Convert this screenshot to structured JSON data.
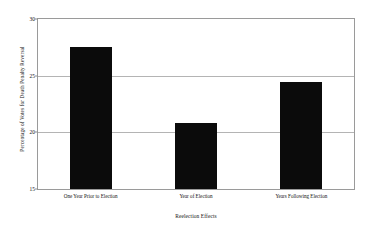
{
  "chart_data": {
    "type": "bar",
    "title": "",
    "subtitle": "",
    "xlabel": "Reelection Effects",
    "ylabel": "Percentage of Votes for Death Penalty Reversal",
    "categories": [
      "One Year Prior to Election",
      "Year of Election",
      "Years Following Election"
    ],
    "values": [
      27.5,
      20.8,
      24.4
    ],
    "series": [
      {
        "name": "Percentage of Votes for Death Penalty Reversal",
        "values": [
          27.5,
          20.8,
          24.4
        ]
      }
    ],
    "ylim": [
      15,
      30
    ],
    "yticks": [
      15,
      20,
      25,
      30
    ],
    "ytick_labels": [
      "15",
      "20",
      "25",
      "30"
    ],
    "xlim": [
      0,
      3
    ],
    "grid": true,
    "grid_axis": "y",
    "legend": false,
    "legend_position": "none",
    "bar_color": "#0b0b0b",
    "grid_color": "#b4b4b4",
    "frame_color": "#9a9a9a",
    "background_color": "#ffffff",
    "annotations": []
  }
}
